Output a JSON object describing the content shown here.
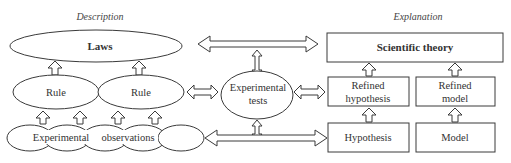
{
  "diagram": {
    "headers": {
      "left": "Description",
      "right": "Explanation"
    },
    "description_side": {
      "laws": "Laws",
      "rules": [
        "Rule",
        "Rule"
      ],
      "observations": {
        "word1": "Experimental",
        "word2": "observations"
      }
    },
    "center": {
      "line1": "Experimental",
      "line2": "tests"
    },
    "explanation_side": {
      "theory": "Scientific theory",
      "refined_hypothesis": {
        "line1": "Refined",
        "line2": "hypothesis"
      },
      "refined_model": {
        "line1": "Refined",
        "line2": "model"
      },
      "hypothesis": "Hypothesis",
      "model": "Model"
    },
    "colors": {
      "stroke": "#3a3a3a",
      "fill": "#ffffff",
      "text": "#333333"
    }
  }
}
